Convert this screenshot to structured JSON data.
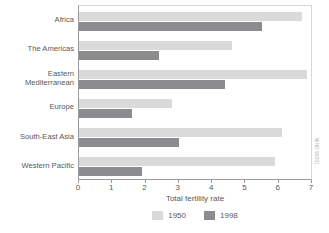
{
  "chart_data": {
    "type": "bar",
    "orientation": "horizontal",
    "title": "",
    "xlabel": "Total fertility rate",
    "ylabel": "",
    "xlim": [
      0,
      7
    ],
    "xticks": [
      0,
      1,
      2,
      3,
      4,
      5,
      6,
      7
    ],
    "grid": false,
    "legend_position": "bottom",
    "categories": [
      "Africa",
      "The Americas",
      "Eastern\nMediterranean",
      "Europe",
      "South-East Asia",
      "Western Pacific"
    ],
    "series": [
      {
        "name": "1950",
        "color": "#dadadb",
        "values": [
          6.7,
          4.6,
          6.85,
          2.8,
          6.1,
          5.9
        ]
      },
      {
        "name": "1998",
        "color": "#8c8c8e",
        "values": [
          5.5,
          2.4,
          4.4,
          1.6,
          3.0,
          1.9
        ]
      }
    ]
  },
  "legend": {
    "items": [
      {
        "label": "1950",
        "color": "#dadadb"
      },
      {
        "label": "1998",
        "color": "#8c8c8e"
      }
    ]
  },
  "source_credit": "WHO 99001",
  "colors": {
    "axis": "#9a9a9c",
    "frame_light": "#d7d7d9",
    "text": "#58585a",
    "series_1950": "#dadadb",
    "series_1998": "#8c8c8e"
  }
}
